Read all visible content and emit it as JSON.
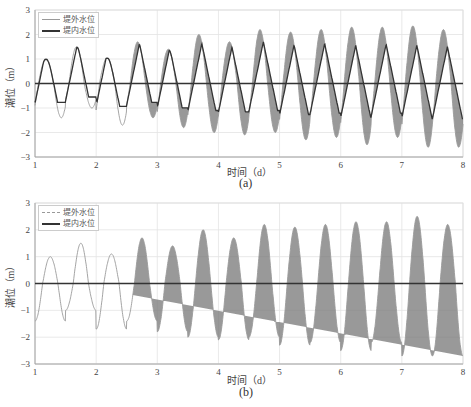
{
  "chart_data": [
    {
      "type": "line",
      "panel": "(a)",
      "xlabel": "时间（d）",
      "ylabel": "潮位（m）",
      "xlim": [
        1,
        8
      ],
      "ylim": [
        -3,
        3
      ],
      "xticks": [
        "1",
        "2",
        "3",
        "4",
        "5",
        "6",
        "7",
        "8"
      ],
      "yticks": [
        "3",
        "2",
        "1",
        "0",
        "-1",
        "-2",
        "-3"
      ],
      "grid": true,
      "legend_position": "upper-left",
      "series": [
        {
          "name": "堤外水位",
          "style": "thin-gray",
          "peaks": [
            1.0,
            1.5,
            1.05,
            1.7,
            1.4,
            2.0,
            1.7,
            2.2,
            2.1,
            2.2,
            2.3,
            2.3,
            2.35,
            2.2
          ],
          "troughs": [
            -1.4,
            -1.0,
            -1.7,
            -1.4,
            -1.8,
            -2.0,
            -2.1,
            -2.0,
            -2.3,
            -2.2,
            -2.5,
            -2.2,
            -2.6
          ]
        },
        {
          "name": "堤内水位",
          "style": "thick-dark",
          "peaks": [
            1.0,
            1.5,
            1.05,
            1.7,
            1.4,
            2.0,
            1.7,
            2.15,
            2.05,
            2.15,
            2.25,
            2.25,
            2.3,
            2.15
          ],
          "troughs": [
            -1.4,
            -1.0,
            -1.6,
            -1.1,
            -1.4,
            -0.9,
            -1.3,
            -1.2,
            -1.3,
            -1.4,
            -1.4,
            -1.4,
            -1.3
          ]
        },
        {
          "name": "zero-line",
          "values": 0
        }
      ]
    },
    {
      "type": "line",
      "panel": "(b)",
      "xlabel": "时间（d）",
      "ylabel": "潮位（m）",
      "xlim": [
        1,
        8
      ],
      "ylim": [
        -3,
        3
      ],
      "xticks": [
        "1",
        "2",
        "3",
        "4",
        "5",
        "6",
        "7",
        "8"
      ],
      "yticks": [
        "3",
        "2",
        "1",
        "0",
        "-1",
        "-2",
        "-3"
      ],
      "grid": true,
      "legend_position": "upper-left",
      "series": [
        {
          "name": "堤外水位",
          "style": "thin-gray",
          "peaks": [
            1.0,
            1.5,
            1.1,
            1.7,
            1.4,
            2.0,
            1.7,
            2.2,
            2.1,
            2.2,
            2.3,
            2.3,
            2.5,
            2.2
          ],
          "troughs": [
            -1.4,
            -1.0,
            -1.7,
            -1.4,
            -1.8,
            -2.0,
            -2.1,
            -2.0,
            -2.3,
            -2.2,
            -2.5,
            -2.2,
            -2.7
          ]
        },
        {
          "name": "堤内水位",
          "style": "thick-dark",
          "peaks": [
            1.4,
            0.8,
            1.6,
            1.4,
            1.7,
            1.6,
            1.7,
            1.7,
            1.7,
            1.7,
            1.7,
            1.7,
            1.7
          ],
          "troughs": [
            -0.45,
            -1.4,
            -1.0,
            -1.4,
            -1.4,
            -1.7,
            -1.7,
            -1.7,
            -1.7,
            -1.8,
            -1.7,
            -1.7,
            -1.7
          ]
        },
        {
          "name": "zero-line",
          "values": 0
        }
      ]
    }
  ],
  "panels": [
    {
      "caption": "(a)",
      "xlabel": "时间（d）",
      "ylabel": "潮位（m）",
      "legend": [
        "堤外水位",
        "堤内水位"
      ]
    },
    {
      "caption": "(b)",
      "xlabel": "时间（d）",
      "ylabel": "潮位（m）",
      "legend": [
        "堤外水位",
        "堤内水位"
      ]
    }
  ]
}
